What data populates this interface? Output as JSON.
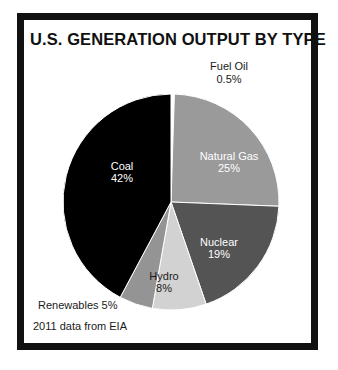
{
  "figure": {
    "title": "U.S. GENERATION OUTPUT BY TYPE",
    "source_note": "2011 data from EIA",
    "frame_color": "#111111",
    "background_color": "#ffffff"
  },
  "labels": {
    "fuel_oil": "Fuel Oil",
    "fuel_oil_pct": "0.5%",
    "natural_gas": "Natural Gas",
    "natural_gas_pct": "25%",
    "nuclear": "Nuclear",
    "nuclear_pct": "19%",
    "hydro": "Hydro",
    "hydro_pct": "8%",
    "renewables": "Renewables 5%",
    "coal": "Coal",
    "coal_pct": "42%"
  },
  "chart_data": {
    "type": "pie",
    "title": "U.S. GENERATION OUTPUT BY TYPE",
    "subtitle": "",
    "xlabel": "",
    "ylabel": "",
    "annotations": [
      "2011 data from EIA"
    ],
    "legend": "none",
    "grid": false,
    "units": "percent",
    "start_angle_deg": 0,
    "direction": "clockwise",
    "center": [
      171,
      202
    ],
    "radius": 108,
    "categories": [
      "Fuel Oil",
      "Natural Gas",
      "Nuclear",
      "Hydro",
      "Renewables",
      "Coal"
    ],
    "values": [
      0.5,
      25,
      19,
      8,
      5,
      42
    ],
    "value_labels": [
      "0.5%",
      "25%",
      "19%",
      "8%",
      "5%",
      "42%"
    ],
    "colors": [
      "#ffffff",
      "#9a9a9a",
      "#545454",
      "#d2d2d2",
      "#949494",
      "#000000"
    ],
    "label_placement": [
      "outside",
      "inside",
      "inside",
      "inside",
      "outside",
      "inside"
    ],
    "label_text_colors": [
      "#1a1a1a",
      "#ffffff",
      "#ffffff",
      "#1a1a1a",
      "#1a1a1a",
      "#ffffff"
    ],
    "slices": [
      {
        "name": "Fuel Oil",
        "value": 0.5,
        "label": "0.5%",
        "color": "#ffffff"
      },
      {
        "name": "Natural Gas",
        "value": 25,
        "label": "25%",
        "color": "#9a9a9a"
      },
      {
        "name": "Nuclear",
        "value": 19,
        "label": "19%",
        "color": "#545454"
      },
      {
        "name": "Hydro",
        "value": 8,
        "label": "8%",
        "color": "#d2d2d2"
      },
      {
        "name": "Renewables",
        "value": 5,
        "label": "5%",
        "color": "#949494"
      },
      {
        "name": "Coal",
        "value": 42,
        "label": "42%",
        "color": "#000000"
      }
    ]
  }
}
